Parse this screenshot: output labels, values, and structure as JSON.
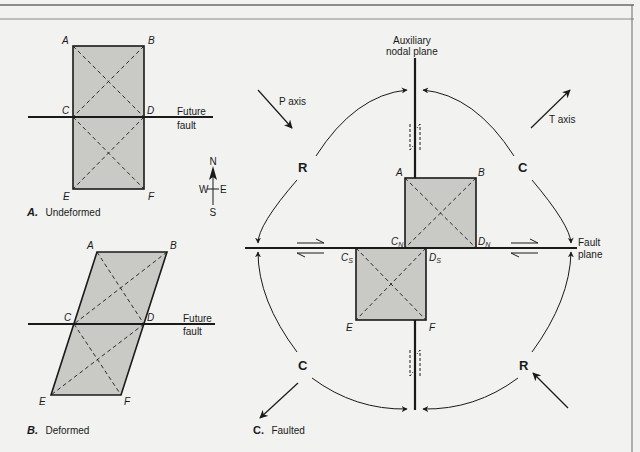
{
  "figure": {
    "colors": {
      "background": "#f2f2f0",
      "block_fill": "#c9c9c6",
      "ink": "#1a1a1a",
      "frame": "#6a6a6a"
    },
    "panel_a": {
      "caption_letter": "A.",
      "caption_text": "Undeformed",
      "points": {
        "A": "A",
        "B": "B",
        "C": "C",
        "D": "D",
        "E": "E",
        "F": "F"
      },
      "fault_label_line1": "Future",
      "fault_label_line2": "fault"
    },
    "compass": {
      "north": "N",
      "south": "S",
      "east": "E",
      "west": "W"
    },
    "panel_b": {
      "caption_letter": "B.",
      "caption_text": "Deformed",
      "points": {
        "A": "A",
        "B": "B",
        "C": "C",
        "D": "D",
        "E": "E",
        "F": "F"
      },
      "fault_label_line1": "Future",
      "fault_label_line2": "fault"
    },
    "panel_c": {
      "caption_letter": "C.",
      "caption_text": "Faulted",
      "aux_plane_line1": "Auxiliary",
      "aux_plane_line2": "nodal plane",
      "fault_plane_line1": "Fault",
      "fault_plane_line2": "plane",
      "p_axis": "P axis",
      "t_axis": "T axis",
      "quadrants": {
        "nw": "R",
        "ne": "C",
        "sw": "C",
        "se": "R"
      },
      "points": {
        "A": "A",
        "B": "B",
        "C": "C",
        "D": "D",
        "E": "E",
        "F": "F",
        "sub_n": "N",
        "sub_s": "S"
      }
    }
  }
}
